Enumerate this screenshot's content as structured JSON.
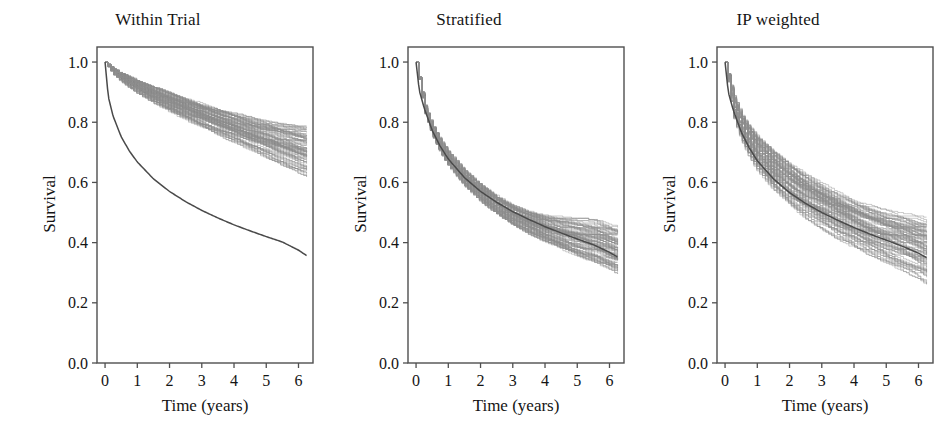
{
  "figure": {
    "background_color": "#ffffff",
    "band_color": "#8f8f8f",
    "line_color": "#4a4a4a",
    "axis_color": "#4f4f4f",
    "text_color": "#141414",
    "panel_count": 3
  },
  "chart_data": [
    {
      "type": "line",
      "title": "Within Trial",
      "xlabel": "Time (years)",
      "ylabel": "Survival",
      "xlim": [
        -0.25,
        6.45
      ],
      "ylim": [
        0.0,
        1.05
      ],
      "xticks": [
        0,
        1,
        2,
        3,
        4,
        5,
        6
      ],
      "xticklabels": [
        "0",
        "1",
        "2",
        "3",
        "4",
        "5",
        "6"
      ],
      "yticks": [
        0.0,
        0.2,
        0.4,
        0.6,
        0.8,
        1.0
      ],
      "yticklabels": [
        "0.0",
        "0.2",
        "0.4",
        "0.6",
        "0.8",
        "1.0"
      ],
      "grid": false,
      "legend": "none",
      "series": [
        {
          "name": "bootstrap-band-upper",
          "role": "band",
          "x": [
            0,
            0.25,
            0.5,
            0.75,
            1.0,
            1.5,
            2.0,
            2.5,
            3.0,
            3.5,
            4.0,
            4.5,
            5.0,
            5.5,
            6.0,
            6.25
          ],
          "values": [
            1.0,
            0.978,
            0.962,
            0.949,
            0.937,
            0.915,
            0.895,
            0.876,
            0.858,
            0.841,
            0.825,
            0.811,
            0.798,
            0.788,
            0.78,
            0.778
          ]
        },
        {
          "name": "bootstrap-band-lower",
          "role": "band",
          "x": [
            0,
            0.25,
            0.5,
            0.75,
            1.0,
            1.5,
            2.0,
            2.5,
            3.0,
            3.5,
            4.0,
            4.5,
            5.0,
            5.5,
            6.0,
            6.25
          ],
          "values": [
            1.0,
            0.96,
            0.936,
            0.916,
            0.898,
            0.866,
            0.837,
            0.81,
            0.784,
            0.76,
            0.736,
            0.712,
            0.688,
            0.664,
            0.64,
            0.628
          ]
        },
        {
          "name": "reference-survival-curve",
          "role": "line",
          "x": [
            0,
            0.1,
            0.25,
            0.5,
            0.75,
            1.0,
            1.5,
            2.0,
            2.5,
            3.0,
            3.5,
            4.0,
            4.5,
            5.0,
            5.5,
            6.0,
            6.25
          ],
          "values": [
            1.0,
            0.885,
            0.82,
            0.752,
            0.705,
            0.668,
            0.612,
            0.57,
            0.536,
            0.507,
            0.482,
            0.459,
            0.439,
            0.42,
            0.402,
            0.375,
            0.357
          ]
        }
      ]
    },
    {
      "type": "line",
      "title": "Stratified",
      "xlabel": "Time (years)",
      "ylabel": "Survival",
      "xlim": [
        -0.25,
        6.45
      ],
      "ylim": [
        0.0,
        1.05
      ],
      "xticks": [
        0,
        1,
        2,
        3,
        4,
        5,
        6
      ],
      "xticklabels": [
        "0",
        "1",
        "2",
        "3",
        "4",
        "5",
        "6"
      ],
      "yticks": [
        0.0,
        0.2,
        0.4,
        0.6,
        0.8,
        1.0
      ],
      "yticklabels": [
        "0.0",
        "0.2",
        "0.4",
        "0.6",
        "0.8",
        "1.0"
      ],
      "grid": false,
      "legend": "none",
      "series": [
        {
          "name": "bootstrap-band-upper",
          "role": "band",
          "x": [
            0,
            0.25,
            0.5,
            0.75,
            1.0,
            1.5,
            2.0,
            2.5,
            3.0,
            3.5,
            4.0,
            4.5,
            5.0,
            5.5,
            6.0,
            6.25
          ],
          "values": [
            1.0,
            0.86,
            0.79,
            0.74,
            0.7,
            0.64,
            0.594,
            0.556,
            0.526,
            0.505,
            0.49,
            0.48,
            0.474,
            0.47,
            0.455,
            0.45
          ]
        },
        {
          "name": "bootstrap-band-lower",
          "role": "band",
          "x": [
            0,
            0.25,
            0.5,
            0.75,
            1.0,
            1.5,
            2.0,
            2.5,
            3.0,
            3.5,
            4.0,
            4.5,
            5.0,
            5.5,
            6.0,
            6.25
          ],
          "values": [
            1.0,
            0.835,
            0.756,
            0.7,
            0.656,
            0.59,
            0.54,
            0.498,
            0.462,
            0.432,
            0.405,
            0.382,
            0.36,
            0.34,
            0.318,
            0.305
          ]
        },
        {
          "name": "reference-survival-curve",
          "role": "line",
          "x": [
            0,
            0.1,
            0.25,
            0.5,
            0.75,
            1.0,
            1.5,
            2.0,
            2.5,
            3.0,
            3.5,
            4.0,
            4.5,
            5.0,
            5.5,
            6.0,
            6.25
          ],
          "values": [
            1.0,
            0.905,
            0.848,
            0.773,
            0.72,
            0.678,
            0.616,
            0.57,
            0.534,
            0.503,
            0.477,
            0.453,
            0.432,
            0.412,
            0.393,
            0.368,
            0.352
          ]
        }
      ]
    },
    {
      "type": "line",
      "title": "IP weighted",
      "xlabel": "Time (years)",
      "ylabel": "Survival",
      "xlim": [
        -0.25,
        6.45
      ],
      "ylim": [
        0.0,
        1.05
      ],
      "xticks": [
        0,
        1,
        2,
        3,
        4,
        5,
        6
      ],
      "xticklabels": [
        "0",
        "1",
        "2",
        "3",
        "4",
        "5",
        "6"
      ],
      "yticks": [
        0.0,
        0.2,
        0.4,
        0.6,
        0.8,
        1.0
      ],
      "yticklabels": [
        "0.0",
        "0.2",
        "0.4",
        "0.6",
        "0.8",
        "1.0"
      ],
      "grid": false,
      "legend": "none",
      "series": [
        {
          "name": "bootstrap-band-upper",
          "role": "band",
          "x": [
            0,
            0.25,
            0.5,
            0.75,
            1.0,
            1.5,
            2.0,
            2.5,
            3.0,
            3.5,
            4.0,
            4.5,
            5.0,
            5.5,
            6.0,
            6.25
          ],
          "values": [
            1.0,
            0.89,
            0.826,
            0.782,
            0.748,
            0.696,
            0.655,
            0.62,
            0.59,
            0.56,
            0.535,
            0.515,
            0.498,
            0.488,
            0.478,
            0.475
          ]
        },
        {
          "name": "bootstrap-band-lower",
          "role": "band",
          "x": [
            0,
            0.25,
            0.5,
            0.75,
            1.0,
            1.5,
            2.0,
            2.5,
            3.0,
            3.5,
            4.0,
            4.5,
            5.0,
            5.5,
            6.0,
            6.25
          ],
          "values": [
            1.0,
            0.82,
            0.742,
            0.686,
            0.642,
            0.578,
            0.528,
            0.486,
            0.45,
            0.418,
            0.39,
            0.364,
            0.34,
            0.315,
            0.29,
            0.272
          ]
        },
        {
          "name": "reference-survival-curve",
          "role": "line",
          "x": [
            0,
            0.1,
            0.25,
            0.5,
            0.75,
            1.0,
            1.5,
            2.0,
            2.5,
            3.0,
            3.5,
            4.0,
            4.5,
            5.0,
            5.5,
            6.0,
            6.25
          ],
          "values": [
            1.0,
            0.9,
            0.842,
            0.768,
            0.715,
            0.672,
            0.612,
            0.566,
            0.53,
            0.5,
            0.474,
            0.45,
            0.428,
            0.408,
            0.388,
            0.365,
            0.35
          ]
        }
      ]
    }
  ]
}
